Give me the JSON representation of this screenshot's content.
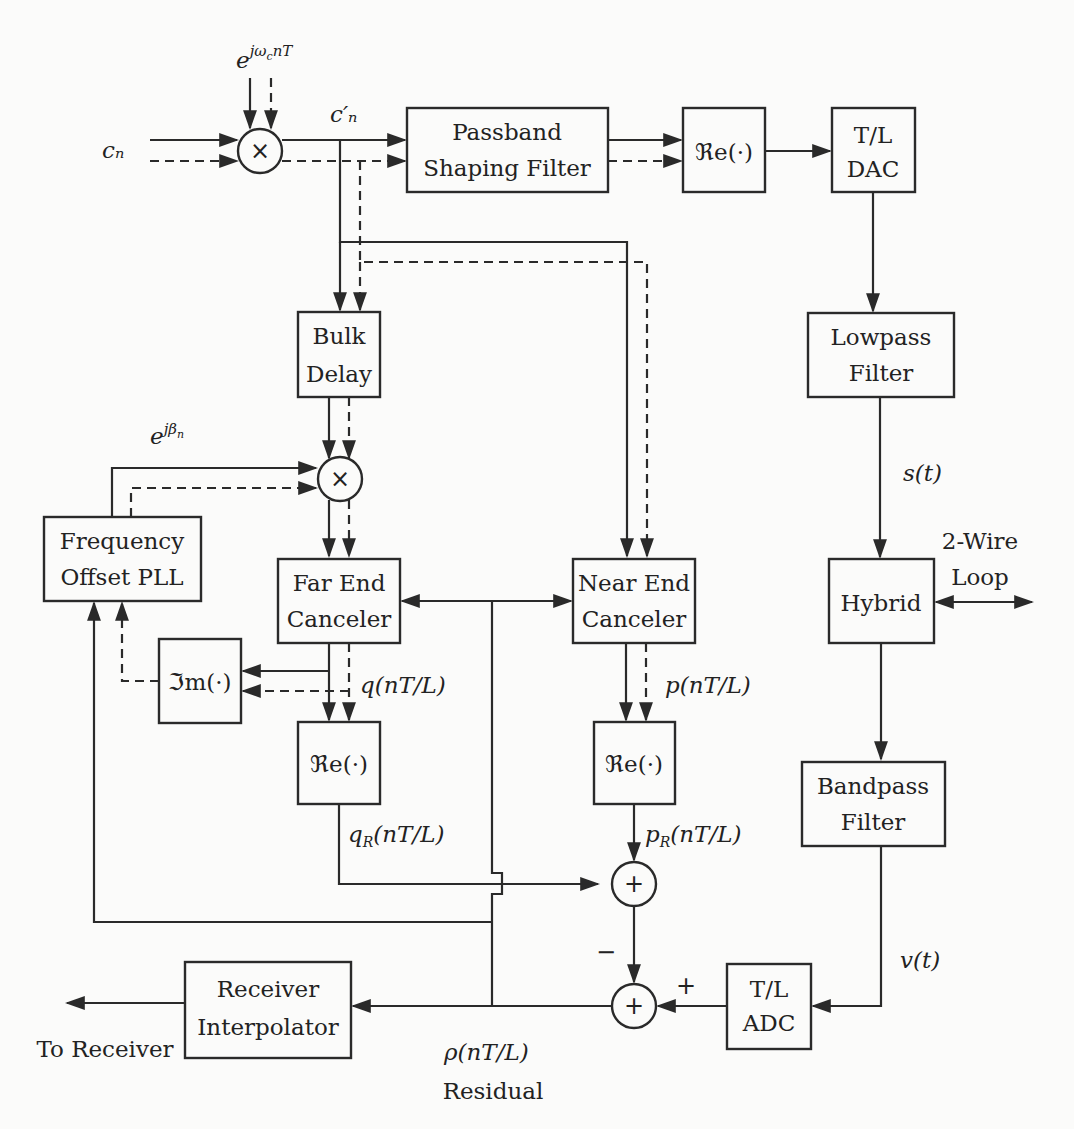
{
  "diagram": {
    "blocks": {
      "passband": {
        "line1": "Passband",
        "line2": "Shaping Filter"
      },
      "re_top": {
        "label": "ℜe(·)"
      },
      "dac": {
        "line1": "T/L",
        "line2": "DAC"
      },
      "lowpass": {
        "line1": "Lowpass",
        "line2": "Filter"
      },
      "hybrid": {
        "label": "Hybrid"
      },
      "bandpass": {
        "line1": "Bandpass",
        "line2": "Filter"
      },
      "adc": {
        "line1": "T/L",
        "line2": "ADC"
      },
      "bulk_delay": {
        "line1": "Bulk",
        "line2": "Delay"
      },
      "freq_pll": {
        "line1": "Frequency",
        "line2": "Offset PLL"
      },
      "far_end": {
        "line1": "Far End",
        "line2": "Canceler"
      },
      "near_end": {
        "line1": "Near End",
        "line2": "Canceler"
      },
      "im": {
        "label": "ℑm(·)"
      },
      "re_far": {
        "label": "ℜe(·)"
      },
      "re_near": {
        "label": "ℜe(·)"
      },
      "receiver_interp": {
        "line1": "Receiver",
        "line2": "Interpolator"
      }
    },
    "operators": {
      "mult": "×",
      "sum": "+"
    },
    "signals": {
      "cn": "cₙ",
      "cn_prime": "c′ₙ",
      "carrier": "e^{jω_c nT}",
      "carrier_base": "e",
      "carrier_sup": "jω",
      "carrier_sub": "c",
      "carrier_sup2": "nT",
      "beta_base": "e",
      "beta_sup": "jβ",
      "beta_sub": "n",
      "st": "s(t)",
      "vt": "v(t)",
      "q": "q(nT/L)",
      "p": "p(nT/L)",
      "qR_base": "q",
      "qR_sub": "R",
      "qR_rest": "(nT/L)",
      "pR_base": "p",
      "pR_sub": "R",
      "pR_rest": "(nT/L)",
      "rho": "ρ(nT/L)",
      "residual": "Residual",
      "two_wire_1": "2-Wire",
      "two_wire_2": "Loop",
      "to_receiver": "To Receiver",
      "minus": "−",
      "plus": "+"
    }
  }
}
